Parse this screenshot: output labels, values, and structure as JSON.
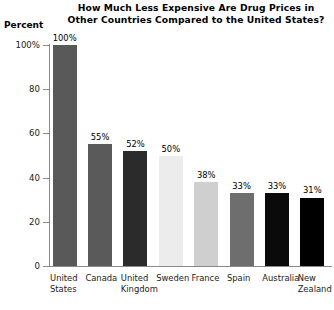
{
  "chart_data": {
    "type": "bar",
    "title": "How Much Less Expensive Are Drug Prices in Other Countries Compared to the United States?",
    "title_lines": [
      "How Much Less Expensive Are Drug Prices in",
      "Other Countries Compared to the United States?"
    ],
    "xlabel": "",
    "ylabel": "Percent",
    "ylim": [
      0,
      100
    ],
    "grid": false,
    "legend": "none",
    "ytick_labels": [
      "100%",
      "80",
      "60",
      "40",
      "20",
      "0"
    ],
    "ytick_values": [
      100,
      80,
      60,
      40,
      20,
      0
    ],
    "categories": [
      "United States",
      "Canada",
      "United Kingdom",
      "Sweden",
      "France",
      "Spain",
      "Australia",
      "New Zealand"
    ],
    "category_lines": [
      [
        "United",
        "States"
      ],
      [
        "Canada",
        ""
      ],
      [
        "United",
        "Kingdom"
      ],
      [
        "Sweden",
        ""
      ],
      [
        "France",
        ""
      ],
      [
        "Spain",
        ""
      ],
      [
        "Australia",
        ""
      ],
      [
        "New",
        "Zealand"
      ]
    ],
    "values": [
      100,
      55,
      52,
      50,
      38,
      33,
      33,
      31
    ],
    "value_labels": [
      "100%",
      "55%",
      "52%",
      "50%",
      "38%",
      "33%",
      "33%",
      "31%"
    ],
    "bar_colors": [
      "#595959",
      "#5a5a5a",
      "#2b2b2b",
      "#ececec",
      "#cfcfcf",
      "#6e6e6e",
      "#0a0a0a",
      "#000000"
    ]
  },
  "axis": {
    "spine_color": "#8a8a8a"
  }
}
